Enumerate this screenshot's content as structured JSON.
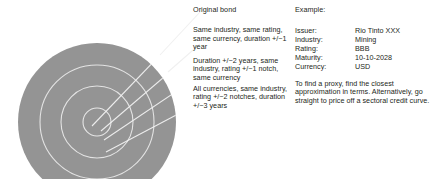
{
  "diagram": {
    "name": "proxy-bond-selection-bullseye",
    "bullseye": {
      "fill_color": "#949494",
      "ring_stroke_color": "#e8e8e8",
      "leader_line_color": "#f2f2f2",
      "ring_count": 4,
      "ring_labels": [
        "Original bond",
        "Same industry, same rating, same currency, duration +/-1 year",
        "Duration +/-2 years, same industry, rating +/-1 notch, same currency",
        "All currencies, same industry, rating +/-2 notches, duration +/-3 years"
      ]
    }
  },
  "original_bond": {
    "heading": "Original bond",
    "tiers": [
      "Same industry, same rating, same currency, duration +/−1 year",
      "Duration +/−2 years, same industry, rating +/−1 notch, same currency",
      "All currencies, same industry, rating +/−2 notches, duration +/−3 years"
    ]
  },
  "example": {
    "heading": "Example:",
    "fields": [
      {
        "label": "Issuer:",
        "value": "Rio Tinto XXX"
      },
      {
        "label": "Industry:",
        "value": "Mining"
      },
      {
        "label": "Rating:",
        "value": "BBB"
      },
      {
        "label": "Maturity:",
        "value": "10-10-2028"
      },
      {
        "label": "Currency:",
        "value": "USD"
      }
    ],
    "note": "To find a proxy, find the closest approximation in terms. Alternatively, go straight to price off a sectoral credit curve."
  }
}
